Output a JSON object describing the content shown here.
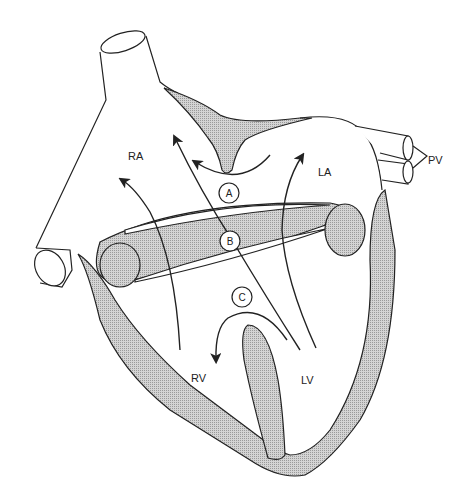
{
  "diagram": {
    "colors": {
      "line": "#222222",
      "fill": "#c8c8c8",
      "background": "#ffffff"
    },
    "chamber_labels": {
      "ra": "RA",
      "la": "LA",
      "rv": "RV",
      "lv": "LV"
    },
    "vessel_labels": {
      "pv": "PV"
    },
    "markers": {
      "a": "A",
      "b": "B",
      "c": "C"
    }
  }
}
